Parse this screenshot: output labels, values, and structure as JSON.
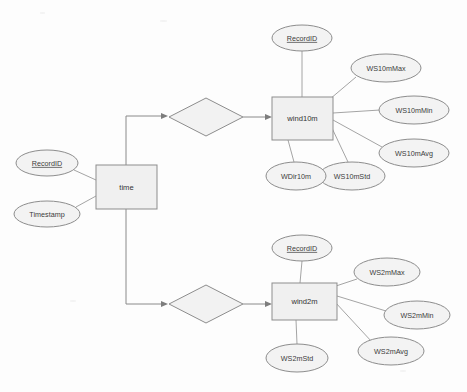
{
  "diagram": {
    "type": "entity-relationship-diagram",
    "canvas": {
      "width": 467,
      "height": 392,
      "background": "#fdfdfd"
    },
    "colors": {
      "entity_fill": "#f0f0f0",
      "attribute_fill": "#f3f3f3",
      "relationship_fill": "#f2f2f2",
      "stroke": "#8d8d8d",
      "text": "#3b3b3b"
    },
    "entities": [
      {
        "id": "time",
        "label": "time",
        "x": 96,
        "y": 165,
        "width": 61,
        "height": 44
      },
      {
        "id": "wind10m",
        "label": "wind10m",
        "x": 272,
        "y": 97,
        "width": 61,
        "height": 43
      },
      {
        "id": "wind2m",
        "label": "wind2m",
        "x": 272,
        "y": 283,
        "width": 65,
        "height": 37
      }
    ],
    "relationships": [
      {
        "id": "rel-time-wind10m",
        "label": "",
        "cx": 206,
        "cy": 117,
        "rx": 37,
        "ry": 19
      },
      {
        "id": "rel-time-wind2m",
        "label": "",
        "cx": 206,
        "cy": 304,
        "rx": 37,
        "ry": 19
      }
    ],
    "attributes": [
      {
        "id": "time-recordid",
        "label": "RecordID",
        "key": true,
        "owner": "time",
        "cx": 47,
        "cy": 163,
        "rx": 31,
        "ry": 13
      },
      {
        "id": "time-timestamp",
        "label": "Timestamp",
        "key": false,
        "owner": "time",
        "cx": 47,
        "cy": 214,
        "rx": 33,
        "ry": 13
      },
      {
        "id": "w10-recordid",
        "label": "RecordID",
        "key": true,
        "owner": "wind10m",
        "cx": 302,
        "cy": 38,
        "rx": 30,
        "ry": 13
      },
      {
        "id": "w10-max",
        "label": "WS10mMax",
        "key": false,
        "owner": "wind10m",
        "cx": 386,
        "cy": 68,
        "rx": 35,
        "ry": 14
      },
      {
        "id": "w10-min",
        "label": "WS10mMin",
        "key": false,
        "owner": "wind10m",
        "cx": 414,
        "cy": 110,
        "rx": 35,
        "ry": 14
      },
      {
        "id": "w10-avg",
        "label": "WS10mAvg",
        "key": false,
        "owner": "wind10m",
        "cx": 414,
        "cy": 153,
        "rx": 35,
        "ry": 14
      },
      {
        "id": "w10-std",
        "label": "WS10mStd",
        "key": false,
        "owner": "wind10m",
        "cx": 352,
        "cy": 176,
        "rx": 33,
        "ry": 14
      },
      {
        "id": "w10-wdir",
        "label": "WDir10m",
        "key": false,
        "owner": "wind10m",
        "cx": 296,
        "cy": 176,
        "rx": 30,
        "ry": 14
      },
      {
        "id": "w2-recordid",
        "label": "RecordID",
        "key": true,
        "owner": "wind2m",
        "cx": 302,
        "cy": 248,
        "rx": 30,
        "ry": 13
      },
      {
        "id": "w2-max",
        "label": "WS2mMax",
        "key": false,
        "owner": "wind2m",
        "cx": 387,
        "cy": 272,
        "rx": 33,
        "ry": 14
      },
      {
        "id": "w2-min",
        "label": "WS2mMin",
        "key": false,
        "owner": "wind2m",
        "cx": 417,
        "cy": 315,
        "rx": 33,
        "ry": 14
      },
      {
        "id": "w2-avg",
        "label": "WS2mAvg",
        "key": false,
        "owner": "wind2m",
        "cx": 391,
        "cy": 351,
        "rx": 33,
        "ry": 14
      },
      {
        "id": "w2-std",
        "label": "WS2mStd",
        "key": false,
        "owner": "wind2m",
        "cx": 297,
        "cy": 358,
        "rx": 31,
        "ry": 14
      }
    ]
  }
}
